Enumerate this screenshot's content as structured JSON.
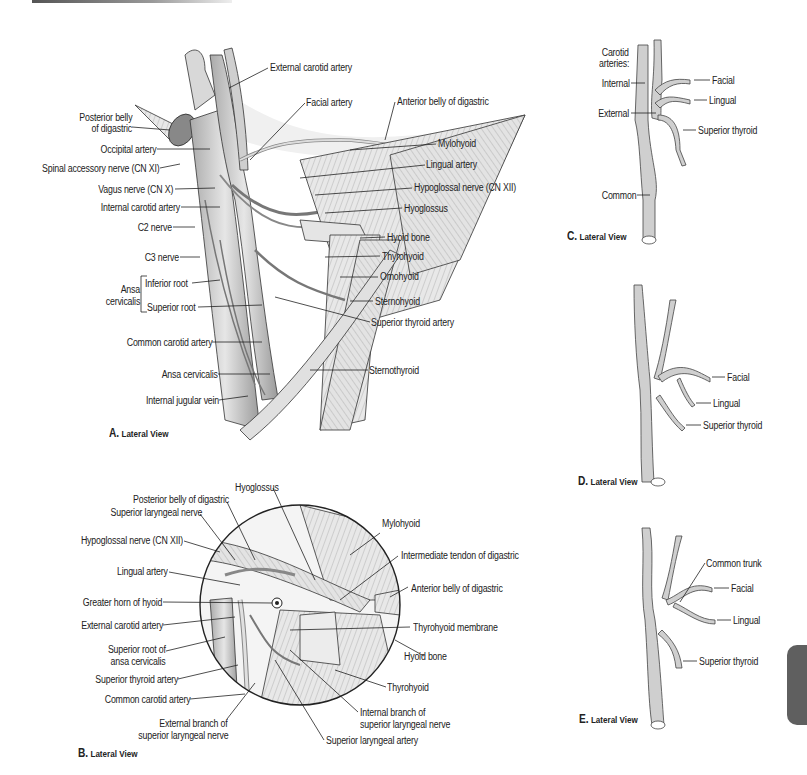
{
  "figure": {
    "panels": [
      {
        "id": "A",
        "caption_letter": "A.",
        "caption_text": "Lateral View"
      },
      {
        "id": "B",
        "caption_letter": "B.",
        "caption_text": "Lateral View"
      },
      {
        "id": "C",
        "caption_letter": "C.",
        "caption_text": "Lateral View"
      },
      {
        "id": "D",
        "caption_letter": "D.",
        "caption_text": "Lateral View"
      },
      {
        "id": "E",
        "caption_letter": "E.",
        "caption_text": "Lateral View"
      }
    ]
  },
  "panelA": {
    "left_labels": [
      "Posterior belly",
      "of digastric",
      "Occipital artery",
      "Spinal accessory nerve (CN XI)",
      "Vagus nerve (CN X)",
      "Internal carotid artery",
      "C2 nerve",
      "C3 nerve",
      "Ansa",
      "cervicalis",
      "Inferior root",
      "Superior root",
      "Common carotid artery",
      "Ansa cervicalis",
      "Internal jugular vein"
    ],
    "right_labels": [
      "External carotid artery",
      "Facial artery",
      "Anterior belly of digastric",
      "Mylohyoid",
      "Lingual artery",
      "Hypoglossal nerve (CN XII)",
      "Hyoglossus",
      "Hyoid bone",
      "Thyrohyoid",
      "Omohyoid",
      "Sternohyoid",
      "Superior thyroid artery",
      "Sternothyroid"
    ]
  },
  "panelB": {
    "left_labels": [
      "Hyoglossus",
      "Posterior belly of digastric",
      "Superior laryngeal nerve",
      "Hypoglossal nerve (CN XII)",
      "Lingual artery",
      "Greater horn of hyoid",
      "External carotid artery",
      "Superior root of",
      "ansa cervicalis",
      "Superior thyroid artery",
      "Common carotid artery",
      "External branch of",
      "superior laryngeal nerve"
    ],
    "right_labels": [
      "Mylohyoid",
      "Intermediate tendon of digastric",
      "Anterior belly of digastric",
      "Thyrohyoid membrane",
      "Hyoid bone",
      "Thyrohyoid",
      "Internal branch of",
      "superior laryngeal nerve",
      "Superior laryngeal artery"
    ]
  },
  "panelC": {
    "labels": [
      "Carotid",
      "arteries:",
      "Internal",
      "External",
      "Common",
      "Facial",
      "Lingual",
      "Superior thyroid"
    ]
  },
  "panelD": {
    "labels": [
      "Facial",
      "Lingual",
      "Superior thyroid"
    ]
  },
  "panelE": {
    "labels": [
      "Common trunk",
      "Facial",
      "Lingual",
      "Superior thyroid"
    ]
  },
  "colors": {
    "line": "#222222",
    "vessel_fill": "#c9c9c9",
    "muscle_fill": "#dcdcdc",
    "tab": "#5f5f5f"
  }
}
